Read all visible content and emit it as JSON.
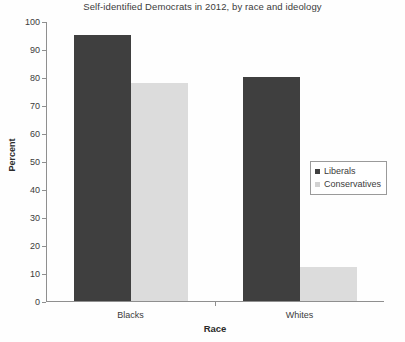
{
  "chart_data": {
    "type": "bar",
    "title": "Self-identified Democrats in 2012, by race and ideology",
    "xlabel": "Race",
    "ylabel": "Percent",
    "categories": [
      "Blacks",
      "Whites"
    ],
    "series": [
      {
        "name": "Liberals",
        "color": "#3f3f3f",
        "values": [
          95,
          80
        ]
      },
      {
        "name": "Conservatives",
        "color": "#dcdcdc",
        "values": [
          78,
          12
        ]
      }
    ],
    "ylim": [
      0,
      100
    ],
    "yticks": [
      0,
      10,
      20,
      30,
      40,
      50,
      60,
      70,
      80,
      90,
      100
    ],
    "ytick_labels": [
      "0",
      "10",
      "20",
      "30",
      "40",
      "50",
      "60",
      "70",
      "80",
      "90",
      "100"
    ],
    "grid": false,
    "legend_position": "center-right"
  },
  "legend": {
    "entries": [
      {
        "label": "Liberals",
        "swatch": "legend-swatch-liberals"
      },
      {
        "label": "Conservatives",
        "swatch": "legend-swatch-conservatives"
      }
    ]
  }
}
